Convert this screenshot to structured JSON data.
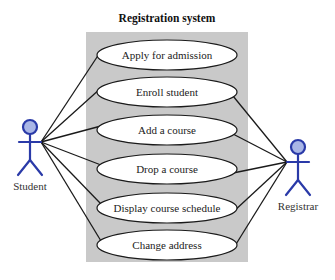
{
  "diagram": {
    "type": "uml-use-case",
    "system": {
      "title": "Registration system"
    },
    "actors": [
      {
        "id": "student",
        "label": "Student"
      },
      {
        "id": "registrar",
        "label": "Registrar"
      }
    ],
    "use_cases": [
      {
        "id": "apply",
        "label": "Apply for admission"
      },
      {
        "id": "enroll",
        "label": "Enroll student"
      },
      {
        "id": "add",
        "label": "Add a course"
      },
      {
        "id": "drop",
        "label": "Drop a course"
      },
      {
        "id": "display",
        "label": "Display course schedule"
      },
      {
        "id": "change",
        "label": "Change address"
      }
    ],
    "associations": [
      {
        "actor": "student",
        "use_case": "apply"
      },
      {
        "actor": "student",
        "use_case": "enroll"
      },
      {
        "actor": "student",
        "use_case": "add"
      },
      {
        "actor": "student",
        "use_case": "drop"
      },
      {
        "actor": "student",
        "use_case": "display"
      },
      {
        "actor": "student",
        "use_case": "change"
      },
      {
        "actor": "registrar",
        "use_case": "enroll"
      },
      {
        "actor": "registrar",
        "use_case": "add"
      },
      {
        "actor": "registrar",
        "use_case": "drop"
      },
      {
        "actor": "registrar",
        "use_case": "display"
      },
      {
        "actor": "registrar",
        "use_case": "change"
      }
    ],
    "colors": {
      "system_fill": "#c9c9c9",
      "actor_stroke": "#2a3aa8",
      "actor_head_fill": "#a9b6e6",
      "line": "#1a1a1a",
      "use_case_fill": "#ffffff"
    }
  }
}
